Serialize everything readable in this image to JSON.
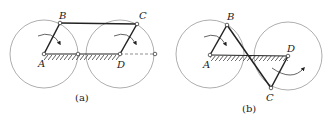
{
  "figure": {
    "panels": [
      {
        "id": "a",
        "caption": "(a)",
        "labels": {
          "A": "A",
          "B": "B",
          "C": "C",
          "D": "D"
        },
        "description": "Parallelogram four-bar linkage: cranks AB and DC parallel, coupler BC parallel to ground AD; both cranks rotate clockwise"
      },
      {
        "id": "b",
        "caption": "(b)",
        "labels": {
          "A": "A",
          "B": "B",
          "C": "C",
          "D": "D"
        },
        "description": "Anti-parallelogram (crossed) four-bar linkage: coupler BC crosses ground AD; cranks rotate in opposite directions"
      }
    ],
    "colors": {
      "ink": "#222222",
      "circle": "#777777",
      "background": "#ffffff"
    }
  }
}
